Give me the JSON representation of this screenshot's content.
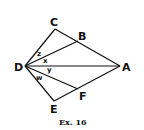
{
  "diagram": {
    "points": {
      "A": {
        "label": "A",
        "x": 120,
        "y": 66
      },
      "B": {
        "label": "B",
        "x": 78,
        "y": 41
      },
      "C": {
        "label": "C",
        "x": 55,
        "y": 29
      },
      "D": {
        "label": "D",
        "x": 25,
        "y": 66
      },
      "E": {
        "label": "E",
        "x": 54,
        "y": 101
      },
      "F": {
        "label": "F",
        "x": 78,
        "y": 89
      }
    },
    "segments": [
      [
        "D",
        "C"
      ],
      [
        "C",
        "A"
      ],
      [
        "D",
        "B"
      ],
      [
        "D",
        "A"
      ],
      [
        "D",
        "F"
      ],
      [
        "D",
        "E"
      ],
      [
        "E",
        "A"
      ]
    ],
    "angle_labels": {
      "z": "z",
      "x": "x",
      "y": "y",
      "w": "w"
    },
    "caption": "Ex. 16"
  }
}
